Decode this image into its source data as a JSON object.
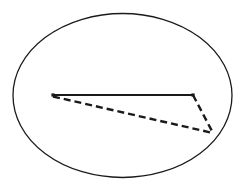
{
  "figure": {
    "title": "",
    "background_color": "#ffffff",
    "stroke_color": "#1a1a1a",
    "canvas": {
      "width": 245,
      "height": 190
    },
    "shapes": {
      "ellipse": {
        "name": "enclosing-ellipse",
        "center": {
          "x": 122.5,
          "y": 95.5
        },
        "radius_x": 109.5,
        "radius_y": 82,
        "stroke_width": 1.3,
        "fill": "none",
        "style": "solid"
      },
      "triangle": {
        "name": "inscribed-triangle",
        "vertices": [
          {
            "label": "A",
            "x": 53,
            "y": 95
          },
          {
            "label": "B",
            "x": 193,
            "y": 95
          },
          {
            "label": "C",
            "x": 213,
            "y": 133
          }
        ],
        "edges": [
          {
            "name": "edge-top-solid",
            "from": "A",
            "to": "B",
            "style": "solid",
            "stroke_width": 2.0,
            "dash_pattern": ""
          },
          {
            "name": "edge-lower-dashed",
            "from": "A",
            "to": "C",
            "style": "dashed",
            "stroke_width": 2.4,
            "dash_pattern": "7 4"
          },
          {
            "name": "edge-right-dashed",
            "from": "B",
            "to": "C",
            "style": "dashed",
            "stroke_width": 2.4,
            "dash_pattern": "7 4"
          }
        ]
      }
    },
    "labels": []
  }
}
